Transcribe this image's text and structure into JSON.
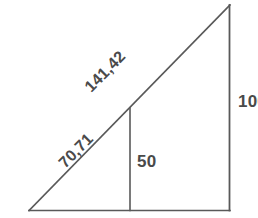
{
  "diagram": {
    "background_color": "#ffffff",
    "line_color": "#595959",
    "label_color": "#4a4a4a",
    "labels": {
      "hypotenuse_upper": "141,42",
      "hypotenuse_lower": "70,71",
      "midsegment": "50",
      "right_side": "100"
    },
    "geometry": {
      "base_left_vertex": "29,210",
      "base_right_vertex": "230,210",
      "apex_vertex": "230,5",
      "midsegment_foot": "130,210",
      "midsegment_top": "130,108"
    }
  }
}
